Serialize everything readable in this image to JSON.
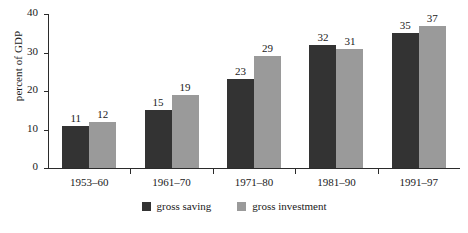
{
  "chart_data": {
    "type": "bar",
    "title": "",
    "xlabel": "",
    "ylabel": "percent of GDP",
    "ylim": [
      0,
      40
    ],
    "yticks": [
      0,
      10,
      20,
      30,
      40
    ],
    "grid": false,
    "legend_position": "bottom-center",
    "categories": [
      "1953–60",
      "1961–70",
      "1971–80",
      "1981–90",
      "1991–97"
    ],
    "series": [
      {
        "name": "gross saving",
        "color": "#333333",
        "values": [
          11,
          15,
          23,
          32,
          35
        ]
      },
      {
        "name": "gross investment",
        "color": "#9a9a9a",
        "values": [
          12,
          19,
          29,
          31,
          37
        ]
      }
    ]
  },
  "axis": {
    "y_title": "percent of GDP",
    "y_tick_labels": [
      "40",
      "30",
      "20",
      "10",
      "0"
    ]
  },
  "legend": {
    "items": [
      {
        "label": "gross saving",
        "color": "#333333"
      },
      {
        "label": "gross investment",
        "color": "#9a9a9a"
      }
    ]
  }
}
